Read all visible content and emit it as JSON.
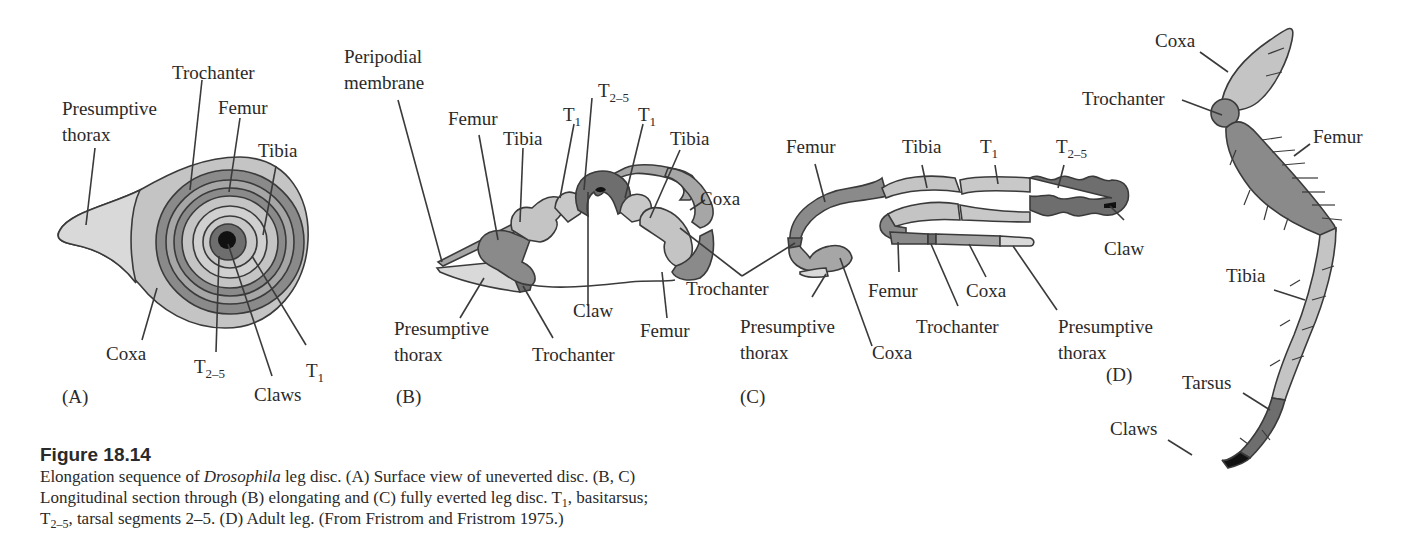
{
  "figure": {
    "number": "Figure 18.14",
    "caption": {
      "line1_pre": "Elongation sequence of ",
      "line1_italic": "Drosophila",
      "line1_post": " leg disc. (A) Surface view of uneverted disc. (B, C)",
      "line2_pre": "Longitudinal section through (B) elongating and (C)  fully everted leg disc. T",
      "line2_sub": "1",
      "line2_post": ", basitarsus;",
      "line3_pre": "T",
      "line3_sub": "2–5",
      "line3_post": ", tarsal segments 2–5. (D) Adult leg. (From Fristrom and Fristrom 1975.)"
    }
  },
  "colors": {
    "outline": "#3a3a3a",
    "very_light": "#d9d9d9",
    "light": "#c4c4c4",
    "mid": "#a6a6a6",
    "dark": "#8a8a8a",
    "darker": "#6e6e6e",
    "black": "#111111"
  },
  "panels": {
    "A": {
      "letter": "(A)",
      "description": "Surface view of uneverted disc",
      "labels": {
        "presumptive_thorax_1": "Presumptive",
        "presumptive_thorax_2": "thorax",
        "trochanter": "Trochanter",
        "femur": "Femur",
        "tibia": "Tibia",
        "coxa": "Coxa",
        "t25_base": "T",
        "t25_sub": "2–5",
        "claws": "Claws",
        "t1_base": "T",
        "t1_sub": "1"
      }
    },
    "B": {
      "letter": "(B)",
      "description": "Longitudinal section through elongating leg disc",
      "labels": {
        "peripodial_1": "Peripodial",
        "peripodial_2": "membrane",
        "femur_top": "Femur",
        "tibia_left": "Tibia",
        "t1_left_base": "T",
        "t1_left_sub": "1",
        "t25_base": "T",
        "t25_sub": "2–5",
        "t1_right_base": "T",
        "t1_right_sub": "1",
        "tibia_right": "Tibia",
        "coxa": "Coxa",
        "presumptive_thorax_1": "Presumptive",
        "presumptive_thorax_2": "thorax",
        "trochanter": "Trochanter",
        "claw": "Claw",
        "femur_bottom": "Femur"
      }
    },
    "C": {
      "letter": "(C)",
      "description": "Longitudinal section through fully everted leg disc",
      "labels": {
        "femur_top": "Femur",
        "tibia": "Tibia",
        "t1_base": "T",
        "t1_sub": "1",
        "t25_base": "T",
        "t25_sub": "2–5",
        "claw": "Claw",
        "trochanter_shared": "Trochanter",
        "presumptive_thorax_left_1": "Presumptive",
        "presumptive_thorax_left_2": "thorax",
        "coxa_left": "Coxa",
        "femur_bottom": "Femur",
        "coxa_right": "Coxa",
        "trochanter_right": "Trochanter",
        "presumptive_thorax_right_1": "Presumptive",
        "presumptive_thorax_right_2": "thorax"
      }
    },
    "D": {
      "letter": "(D)",
      "description": "Adult leg",
      "labels": {
        "coxa": "Coxa",
        "trochanter": "Trochanter",
        "femur": "Femur",
        "tibia": "Tibia",
        "tarsus": "Tarsus",
        "claws": "Claws"
      }
    }
  }
}
